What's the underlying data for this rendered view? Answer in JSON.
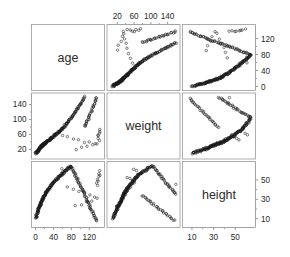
{
  "figure": {
    "kind": "scatterplot-matrix",
    "background": "#ffffff",
    "frame_color": "#9a9a9a",
    "point_color": "#1a1a1a",
    "tick_color": "#6e6e6e",
    "variables": [
      "age",
      "weight",
      "height"
    ],
    "diagonal_labels": {
      "age": "age",
      "weight": "weight",
      "height": "height"
    }
  },
  "axes": {
    "top_weight": {
      "position": "top",
      "variable": "weight",
      "ticks": [
        20,
        60,
        100,
        140
      ],
      "labels": [
        "20",
        "60",
        "100",
        "140"
      ]
    },
    "right_age": {
      "position": "right",
      "variable": "age",
      "ticks": [
        0,
        40,
        80,
        120
      ],
      "labels": [
        "0",
        "40",
        "80",
        "120"
      ]
    },
    "left_weight": {
      "position": "left",
      "variable": "weight",
      "ticks": [
        20,
        60,
        100,
        140
      ],
      "labels": [
        "20",
        "60",
        "100",
        "140"
      ]
    },
    "right_height": {
      "position": "right",
      "variable": "height",
      "ticks": [
        10,
        30,
        50
      ],
      "labels": [
        "10",
        "30",
        "50"
      ]
    },
    "bottom_age": {
      "position": "bottom",
      "variable": "age",
      "ticks": [
        0,
        40,
        80,
        120
      ],
      "labels": [
        "0",
        "40",
        "80",
        "120"
      ]
    },
    "bottom_height": {
      "position": "bottom",
      "variable": "height",
      "ticks": [
        10,
        30,
        50
      ],
      "labels": [
        "10",
        "30",
        "50"
      ]
    }
  },
  "chart_data": {
    "type": "scatter",
    "title": "",
    "subtitle": "",
    "xlabel": "",
    "ylabel": "",
    "grid": false,
    "legend": "none",
    "matrix": {
      "rows": [
        "age",
        "weight",
        "height"
      ],
      "cols": [
        "age",
        "weight",
        "height"
      ],
      "diagonal": "variable-name-panel"
    },
    "ranges": {
      "age": [
        0,
        145
      ],
      "weight": [
        5,
        160
      ],
      "height": [
        5,
        65
      ]
    },
    "variables": {
      "age": {
        "min": 0,
        "max": 145,
        "unit": "months"
      },
      "weight": {
        "min": 5,
        "max": 160,
        "unit": "kg"
      },
      "height": {
        "min": 5,
        "max": 65,
        "unit": "cm"
      }
    },
    "relationships": [
      {
        "pair": "weight-vs-age",
        "panel": "row1col2",
        "x": "weight",
        "y": "age",
        "correlation": "strong positive, saturating at high weight"
      },
      {
        "pair": "height-vs-age",
        "panel": "row1col3",
        "x": "height",
        "y": "age",
        "correlation": "strong positive, fanning"
      },
      {
        "pair": "age-vs-weight",
        "panel": "row2col1",
        "x": "age",
        "y": "weight",
        "correlation": "strong positive, widening spread"
      },
      {
        "pair": "height-vs-weight",
        "panel": "row2col3",
        "x": "height",
        "y": "weight",
        "correlation": "strong positive, convex"
      },
      {
        "pair": "age-vs-height",
        "panel": "row3col1",
        "x": "age",
        "y": "height",
        "correlation": "strong positive, concave"
      },
      {
        "pair": "weight-vs-height",
        "panel": "row3col2",
        "x": "weight",
        "y": "height",
        "correlation": "strong positive, concave"
      }
    ],
    "n_points": 240,
    "points": {
      "age": [
        1,
        1,
        2,
        2,
        2,
        3,
        3,
        3,
        3,
        4,
        4,
        4,
        5,
        5,
        5,
        5,
        6,
        6,
        6,
        7,
        7,
        7,
        7,
        8,
        8,
        8,
        9,
        9,
        9,
        9,
        10,
        10,
        10,
        11,
        11,
        11,
        12,
        12,
        12,
        12,
        13,
        13,
        13,
        14,
        14,
        14,
        14,
        15,
        15,
        15,
        16,
        16,
        16,
        17,
        17,
        17,
        18,
        18,
        18,
        19,
        19,
        19,
        20,
        20,
        20,
        21,
        21,
        22,
        22,
        22,
        23,
        23,
        24,
        24,
        25,
        25,
        26,
        26,
        27,
        27,
        28,
        28,
        29,
        29,
        30,
        30,
        31,
        31,
        32,
        32,
        33,
        34,
        34,
        35,
        35,
        36,
        37,
        37,
        38,
        38,
        39,
        40,
        40,
        41,
        42,
        42,
        43,
        44,
        44,
        45,
        46,
        46,
        47,
        48,
        49,
        49,
        50,
        51,
        52,
        52,
        53,
        54,
        55,
        55,
        56,
        57,
        58,
        58,
        59,
        60,
        60,
        61,
        62,
        63,
        63,
        64,
        65,
        66,
        66,
        67,
        68,
        69,
        70,
        70,
        71,
        72,
        73,
        74,
        74,
        75,
        76,
        77,
        78,
        79,
        80,
        80,
        81,
        82,
        83,
        84,
        85,
        86,
        87,
        88,
        89,
        90,
        91,
        92,
        93,
        94,
        95,
        96,
        97,
        98,
        99,
        100,
        101,
        102,
        103,
        104,
        105,
        106,
        107,
        108,
        109,
        110,
        111,
        112,
        113,
        114,
        115,
        116,
        117,
        118,
        119,
        120,
        121,
        122,
        123,
        124,
        125,
        126,
        127,
        128,
        129,
        130,
        131,
        132,
        133,
        134,
        135,
        136,
        137,
        138,
        139,
        140,
        141,
        142,
        143,
        144,
        60,
        72,
        84,
        96,
        108,
        120,
        132,
        138,
        126,
        114,
        102,
        90,
        78,
        66,
        54,
        42,
        30,
        18,
        9,
        5
      ],
      "weight": [
        9,
        10,
        10,
        11,
        12,
        11,
        12,
        13,
        14,
        13,
        14,
        15,
        14,
        15,
        16,
        17,
        16,
        17,
        18,
        17,
        18,
        19,
        20,
        19,
        20,
        21,
        20,
        21,
        22,
        23,
        22,
        23,
        24,
        23,
        24,
        25,
        24,
        25,
        26,
        27,
        26,
        27,
        28,
        27,
        28,
        29,
        30,
        29,
        30,
        31,
        30,
        31,
        32,
        31,
        32,
        33,
        32,
        33,
        34,
        33,
        34,
        35,
        34,
        35,
        36,
        35,
        36,
        36,
        37,
        38,
        37,
        38,
        38,
        39,
        39,
        40,
        40,
        41,
        41,
        42,
        42,
        43,
        43,
        44,
        44,
        45,
        45,
        46,
        46,
        47,
        47,
        48,
        49,
        49,
        50,
        50,
        51,
        52,
        52,
        53,
        53,
        54,
        55,
        55,
        56,
        57,
        57,
        58,
        59,
        59,
        60,
        61,
        61,
        62,
        63,
        64,
        64,
        65,
        66,
        67,
        67,
        68,
        69,
        70,
        70,
        71,
        72,
        73,
        74,
        75,
        76,
        77,
        78,
        79,
        80,
        81,
        82,
        83,
        84,
        85,
        86,
        88,
        89,
        90,
        91,
        92,
        94,
        95,
        96,
        98,
        99,
        101,
        102,
        104,
        105,
        107,
        108,
        110,
        111,
        113,
        115,
        116,
        118,
        120,
        121,
        123,
        125,
        127,
        128,
        130,
        132,
        134,
        136,
        138,
        140,
        142,
        144,
        146,
        148,
        150,
        152,
        154,
        156,
        158,
        160,
        80,
        82,
        85,
        88,
        90,
        93,
        96,
        99,
        102,
        105,
        108,
        111,
        114,
        117,
        120,
        123,
        126,
        129,
        132,
        135,
        138,
        141,
        144,
        147,
        150,
        153,
        156,
        159,
        60,
        55,
        50,
        45,
        70,
        75,
        65,
        58,
        52,
        48,
        44,
        40,
        38,
        36,
        34,
        32,
        28,
        24,
        20,
        16
      ],
      "height": [
        10,
        11,
        11,
        12,
        12,
        13,
        13,
        14,
        14,
        15,
        15,
        16,
        16,
        17,
        17,
        18,
        18,
        18,
        19,
        19,
        20,
        20,
        20,
        21,
        21,
        22,
        22,
        22,
        23,
        23,
        23,
        24,
        24,
        24,
        25,
        25,
        25,
        26,
        26,
        26,
        27,
        27,
        27,
        28,
        28,
        28,
        29,
        29,
        29,
        30,
        30,
        30,
        31,
        31,
        31,
        32,
        32,
        32,
        33,
        33,
        33,
        34,
        34,
        34,
        35,
        35,
        35,
        36,
        36,
        36,
        37,
        37,
        37,
        38,
        38,
        38,
        39,
        39,
        39,
        40,
        40,
        40,
        41,
        41,
        41,
        42,
        42,
        42,
        43,
        43,
        43,
        44,
        44,
        44,
        45,
        45,
        45,
        46,
        46,
        46,
        47,
        47,
        47,
        48,
        48,
        48,
        49,
        49,
        49,
        50,
        50,
        50,
        51,
        51,
        51,
        52,
        52,
        52,
        53,
        53,
        53,
        54,
        54,
        54,
        55,
        55,
        55,
        56,
        56,
        56,
        57,
        57,
        57,
        58,
        58,
        58,
        59,
        59,
        59,
        60,
        60,
        60,
        61,
        61,
        61,
        62,
        62,
        62,
        63,
        63,
        63,
        64,
        64,
        64,
        64,
        64,
        63,
        62,
        61,
        60,
        59,
        58,
        57,
        56,
        55,
        54,
        53,
        52,
        51,
        50,
        49,
        48,
        47,
        46,
        45,
        44,
        43,
        42,
        41,
        40,
        39,
        38,
        37,
        36,
        35,
        34,
        33,
        32,
        31,
        30,
        29,
        28,
        27,
        26,
        25,
        24,
        23,
        22,
        21,
        20,
        19,
        18,
        17,
        16,
        15,
        14,
        13,
        12,
        11,
        10,
        9,
        8,
        45,
        47,
        49,
        51,
        53,
        55,
        57,
        59,
        61,
        43,
        41,
        39,
        37,
        35,
        33,
        31,
        29,
        27,
        25,
        23
      ]
    }
  }
}
